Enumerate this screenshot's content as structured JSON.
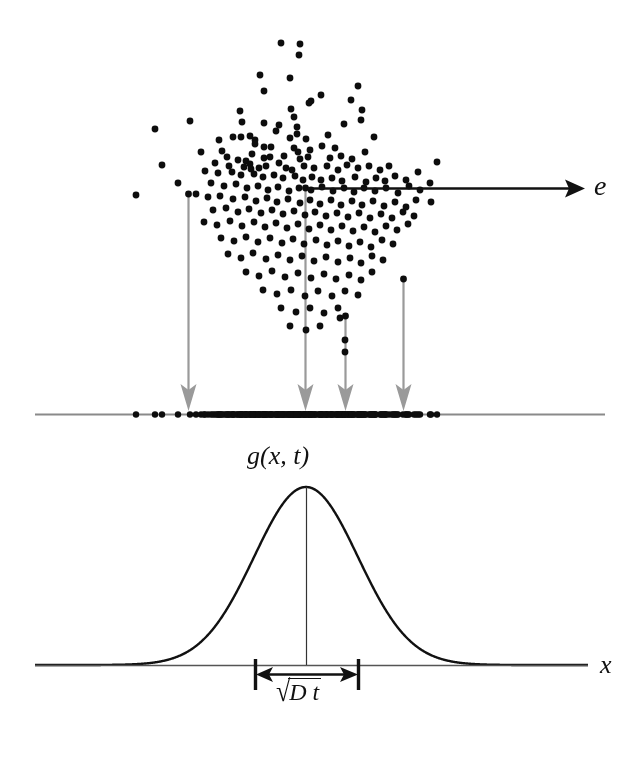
{
  "figure": {
    "background_color": "#ffffff",
    "width": 641,
    "height": 763
  },
  "labels": {
    "direction_vector": "e",
    "x_axis": "x",
    "density_function": "g(x, t)",
    "width_radical_glyph": "√",
    "width_body": "D t",
    "width_full": "√Dt"
  },
  "colors": {
    "ink": "#111111",
    "projection_guides": "#9a9a9a",
    "axis_line": "#8a8a8a",
    "dot": "#0d0d0d",
    "curve": "#111111"
  },
  "elements": {
    "e_arrow": {
      "name": "direction-vector-arrow",
      "x1": 308,
      "y1": 188,
      "x2": 583,
      "y2": 188,
      "color": "#111111",
      "stroke_width": 2.6,
      "head": "filled-triangle"
    },
    "projection_axis": {
      "name": "projection-axis-line",
      "x1": 35,
      "y1": 414,
      "x2": 605,
      "y2": 414,
      "color": "#8a8a8a",
      "stroke_width": 2.2
    },
    "x_axis": {
      "name": "x-axis-line",
      "x1": 35,
      "y1": 665,
      "x2": 588,
      "y2": 665,
      "color": "#555555",
      "stroke_width": 1.6
    },
    "center_vertical": {
      "name": "gaussian-center-line",
      "x": 306,
      "y_top": 487,
      "y_bottom": 665,
      "color": "#333333",
      "stroke_width": 1.2
    },
    "width_bar": {
      "name": "sqrt-dt-measure",
      "left_tick_x": 255,
      "right_tick_x": 358,
      "tick_top": 659,
      "tick_bottom": 690,
      "arrow_y": 674,
      "color": "#111111"
    }
  },
  "guide_arrows": [
    {
      "name": "projection-guide-1",
      "x": 188,
      "y_start": 194,
      "y_end": 412
    },
    {
      "name": "projection-guide-2",
      "x": 305,
      "y_start": 188,
      "y_end": 412
    },
    {
      "name": "projection-guide-3",
      "x": 345,
      "y_start": 316,
      "y_end": 412
    },
    {
      "name": "projection-guide-4",
      "x": 403,
      "y_start": 279,
      "y_end": 412
    }
  ],
  "chart_data": {
    "type": "scatter",
    "title": "g(x, t)",
    "xlabel": "x",
    "ylabel": "",
    "grid": false,
    "legend": null,
    "annotations": [
      {
        "text": "e",
        "kind": "vector-label",
        "x": 594,
        "y": 188
      },
      {
        "text": "g(x, t)",
        "kind": "curve-label",
        "x": 306,
        "y": 455
      },
      {
        "text": "√Dt",
        "kind": "width-label",
        "x": 306,
        "y": 690
      },
      {
        "text": "x",
        "kind": "axis-label",
        "x": 600,
        "y": 665
      }
    ],
    "panels": [
      {
        "name": "scatter-cloud",
        "type": "scatter",
        "description": "2D Gaussian cloud of Brownian particles",
        "point_count": 208,
        "center": [
          300,
          215
        ],
        "sigma": [
          62,
          70
        ],
        "point_radius": 3.4,
        "xlim": [
          120,
          450
        ],
        "ylim": [
          40,
          370
        ]
      },
      {
        "name": "projection-rug",
        "type": "rug",
        "description": "Particles projected onto the e direction, forming a dense 1D cluster",
        "point_count": 208,
        "axis_y": 414,
        "center_x": 300,
        "sigma_x": 62,
        "point_radius": 3.2,
        "xlim": [
          120,
          450
        ]
      },
      {
        "name": "gaussian-curve",
        "type": "line",
        "description": "Gaussian probability density g(x,t) of the projected coordinate",
        "peak_x": 306,
        "peak_y": 487,
        "baseline_y": 665,
        "sigma_px": 52,
        "amplitude_px": 178,
        "x_start": 35,
        "x_end": 588,
        "ylim": [
          0,
          1
        ]
      }
    ],
    "series": [
      {
        "name": "gaussian-density",
        "formula": "g(x,t) = exp(-(x-x0)^2 / (2 sigma^2))",
        "x": [
          -4.0,
          -3.5,
          -3.0,
          -2.5,
          -2.0,
          -1.5,
          -1.0,
          -0.5,
          0.0,
          0.5,
          1.0,
          1.5,
          2.0,
          2.5,
          3.0,
          3.5,
          4.0
        ],
        "values": [
          0.0003,
          0.0022,
          0.011,
          0.044,
          0.135,
          0.325,
          0.607,
          0.882,
          1.0,
          0.882,
          0.607,
          0.325,
          0.135,
          0.044,
          0.011,
          0.0022,
          0.0003
        ]
      }
    ],
    "scatter_points": [
      [
        281,
        43
      ],
      [
        300,
        44
      ],
      [
        299,
        55
      ],
      [
        260,
        75
      ],
      [
        290,
        78
      ],
      [
        358,
        86
      ],
      [
        264,
        91
      ],
      [
        321,
        95
      ],
      [
        311,
        101
      ],
      [
        291,
        109
      ],
      [
        294,
        117
      ],
      [
        240,
        111
      ],
      [
        362,
        110
      ],
      [
        309,
        103
      ],
      [
        351,
        100
      ],
      [
        297,
        127
      ],
      [
        361,
        120
      ],
      [
        344,
        124
      ],
      [
        190,
        121
      ],
      [
        242,
        122
      ],
      [
        264,
        123
      ],
      [
        279,
        125
      ],
      [
        276,
        131
      ],
      [
        297,
        134
      ],
      [
        241,
        137
      ],
      [
        250,
        136
      ],
      [
        233,
        137
      ],
      [
        255,
        140
      ],
      [
        328,
        135
      ],
      [
        374,
        137
      ],
      [
        219,
        140
      ],
      [
        306,
        139
      ],
      [
        290,
        138
      ],
      [
        255,
        144
      ],
      [
        264,
        147
      ],
      [
        271,
        147
      ],
      [
        294,
        148
      ],
      [
        298,
        152
      ],
      [
        310,
        150
      ],
      [
        322,
        146
      ],
      [
        335,
        148
      ],
      [
        201,
        152
      ],
      [
        222,
        151
      ],
      [
        252,
        154
      ],
      [
        264,
        158
      ],
      [
        270,
        157
      ],
      [
        284,
        156
      ],
      [
        300,
        159
      ],
      [
        308,
        157
      ],
      [
        330,
        158
      ],
      [
        341,
        156
      ],
      [
        352,
        159
      ],
      [
        365,
        152
      ],
      [
        227,
        157
      ],
      [
        238,
        160
      ],
      [
        246,
        161
      ],
      [
        250,
        164
      ],
      [
        215,
        163
      ],
      [
        229,
        166
      ],
      [
        244,
        167
      ],
      [
        251,
        169
      ],
      [
        259,
        168
      ],
      [
        266,
        166
      ],
      [
        279,
        163
      ],
      [
        286,
        168
      ],
      [
        292,
        170
      ],
      [
        304,
        166
      ],
      [
        314,
        168
      ],
      [
        327,
        166
      ],
      [
        338,
        170
      ],
      [
        347,
        165
      ],
      [
        358,
        168
      ],
      [
        369,
        166
      ],
      [
        380,
        170
      ],
      [
        389,
        166
      ],
      [
        205,
        171
      ],
      [
        218,
        173
      ],
      [
        232,
        172
      ],
      [
        241,
        175
      ],
      [
        254,
        174
      ],
      [
        263,
        177
      ],
      [
        274,
        175
      ],
      [
        283,
        178
      ],
      [
        295,
        176
      ],
      [
        303,
        180
      ],
      [
        312,
        177
      ],
      [
        321,
        180
      ],
      [
        332,
        178
      ],
      [
        342,
        181
      ],
      [
        355,
        177
      ],
      [
        366,
        182
      ],
      [
        376,
        178
      ],
      [
        385,
        181
      ],
      [
        395,
        176
      ],
      [
        406,
        180
      ],
      [
        418,
        172
      ],
      [
        211,
        183
      ],
      [
        224,
        186
      ],
      [
        236,
        184
      ],
      [
        247,
        188
      ],
      [
        258,
        186
      ],
      [
        268,
        190
      ],
      [
        278,
        187
      ],
      [
        289,
        191
      ],
      [
        299,
        188
      ],
      [
        311,
        190
      ],
      [
        322,
        187
      ],
      [
        333,
        191
      ],
      [
        344,
        188
      ],
      [
        354,
        192
      ],
      [
        364,
        188
      ],
      [
        375,
        191
      ],
      [
        386,
        188
      ],
      [
        398,
        193
      ],
      [
        409,
        186
      ],
      [
        420,
        190
      ],
      [
        430,
        183
      ],
      [
        196,
        194
      ],
      [
        208,
        197
      ],
      [
        220,
        196
      ],
      [
        233,
        199
      ],
      [
        245,
        197
      ],
      [
        256,
        201
      ],
      [
        267,
        198
      ],
      [
        277,
        202
      ],
      [
        288,
        199
      ],
      [
        300,
        203
      ],
      [
        310,
        200
      ],
      [
        320,
        204
      ],
      [
        331,
        200
      ],
      [
        341,
        205
      ],
      [
        352,
        201
      ],
      [
        362,
        205
      ],
      [
        373,
        201
      ],
      [
        384,
        206
      ],
      [
        395,
        202
      ],
      [
        406,
        207
      ],
      [
        416,
        200
      ],
      [
        213,
        210
      ],
      [
        226,
        208
      ],
      [
        238,
        212
      ],
      [
        249,
        209
      ],
      [
        261,
        213
      ],
      [
        272,
        210
      ],
      [
        283,
        214
      ],
      [
        294,
        211
      ],
      [
        305,
        215
      ],
      [
        315,
        212
      ],
      [
        326,
        216
      ],
      [
        337,
        213
      ],
      [
        348,
        217
      ],
      [
        359,
        213
      ],
      [
        370,
        218
      ],
      [
        381,
        214
      ],
      [
        392,
        218
      ],
      [
        403,
        212
      ],
      [
        414,
        216
      ],
      [
        204,
        222
      ],
      [
        217,
        225
      ],
      [
        230,
        221
      ],
      [
        242,
        226
      ],
      [
        254,
        222
      ],
      [
        265,
        227
      ],
      [
        276,
        223
      ],
      [
        287,
        228
      ],
      [
        298,
        224
      ],
      [
        309,
        229
      ],
      [
        320,
        225
      ],
      [
        331,
        230
      ],
      [
        342,
        226
      ],
      [
        353,
        231
      ],
      [
        364,
        227
      ],
      [
        375,
        232
      ],
      [
        386,
        226
      ],
      [
        397,
        230
      ],
      [
        408,
        224
      ],
      [
        221,
        238
      ],
      [
        234,
        241
      ],
      [
        246,
        237
      ],
      [
        258,
        242
      ],
      [
        270,
        238
      ],
      [
        282,
        243
      ],
      [
        293,
        239
      ],
      [
        304,
        244
      ],
      [
        316,
        240
      ],
      [
        327,
        245
      ],
      [
        338,
        241
      ],
      [
        349,
        246
      ],
      [
        360,
        242
      ],
      [
        371,
        247
      ],
      [
        382,
        240
      ],
      [
        393,
        244
      ],
      [
        228,
        254
      ],
      [
        241,
        258
      ],
      [
        253,
        253
      ],
      [
        266,
        259
      ],
      [
        278,
        255
      ],
      [
        290,
        260
      ],
      [
        302,
        256
      ],
      [
        314,
        261
      ],
      [
        326,
        257
      ],
      [
        338,
        262
      ],
      [
        350,
        258
      ],
      [
        361,
        263
      ],
      [
        372,
        256
      ],
      [
        383,
        260
      ],
      [
        246,
        272
      ],
      [
        259,
        276
      ],
      [
        272,
        271
      ],
      [
        285,
        277
      ],
      [
        298,
        273
      ],
      [
        311,
        278
      ],
      [
        324,
        274
      ],
      [
        336,
        279
      ],
      [
        349,
        275
      ],
      [
        361,
        280
      ],
      [
        372,
        272
      ],
      [
        263,
        290
      ],
      [
        277,
        294
      ],
      [
        291,
        290
      ],
      [
        305,
        296
      ],
      [
        318,
        291
      ],
      [
        332,
        296
      ],
      [
        345,
        291
      ],
      [
        358,
        295
      ],
      [
        281,
        308
      ],
      [
        296,
        312
      ],
      [
        310,
        308
      ],
      [
        324,
        313
      ],
      [
        338,
        308
      ],
      [
        290,
        326
      ],
      [
        306,
        330
      ],
      [
        320,
        326
      ],
      [
        340,
        318
      ],
      [
        345,
        340
      ],
      [
        345,
        352
      ],
      [
        155,
        129
      ],
      [
        162,
        165
      ],
      [
        178,
        183
      ],
      [
        136,
        195
      ],
      [
        431,
        202
      ],
      [
        437,
        162
      ]
    ]
  }
}
